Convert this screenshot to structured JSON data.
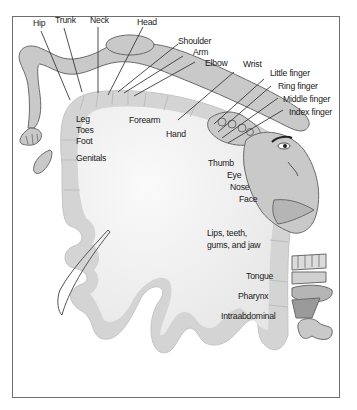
{
  "figure": {
    "colors": {
      "frame": "#6e6e6e",
      "body_fill": "#c9c9c9",
      "body_stroke": "#6a6a6a",
      "cortex_band": "#d6d6d6",
      "cortex_inner": "#f2f2f2",
      "text": "#1a1a1a"
    }
  },
  "labels": {
    "outer": {
      "hip": "Hip",
      "trunk": "Trunk",
      "neck": "Neck",
      "head": "Head",
      "shoulder": "Shoulder",
      "arm": "Arm",
      "elbow": "Elbow",
      "wrist": "Wrist",
      "little_finger": "Little finger",
      "ring_finger": "Ring finger",
      "middle_finger": "Middle finger",
      "index_finger": "Index finger"
    },
    "inner": {
      "leg": "Leg",
      "toes": "Toes",
      "foot": "Foot",
      "genitals": "Genitals",
      "forearm": "Forearm",
      "hand": "Hand",
      "thumb": "Thumb",
      "eye": "Eye",
      "nose": "Nose",
      "face": "Face",
      "lips_line1": "Lips, teeth,",
      "lips_line2": "gums, and jaw",
      "tongue": "Tongue",
      "pharynx": "Pharynx",
      "intraabdominal": "Intraabdominal"
    }
  }
}
